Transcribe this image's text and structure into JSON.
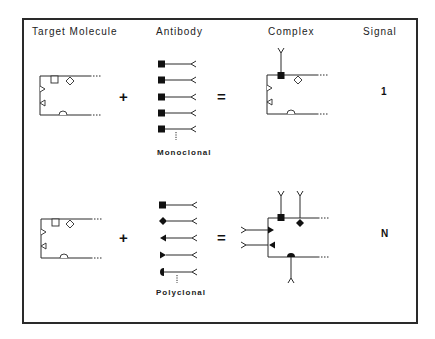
{
  "headers": {
    "target_molecule": "Target Molecule",
    "antibody": "Antibody",
    "complex": "Complex",
    "signal": "Signal"
  },
  "rows": [
    {
      "name": "monoclonal",
      "operator_plus": "+",
      "operator_equals": "=",
      "antibody_label": "Monoclonal",
      "antibody_heads": [
        "square",
        "square",
        "square",
        "square",
        "square"
      ],
      "complex_bound_sites": [
        "square"
      ],
      "signal": "1"
    },
    {
      "name": "polyclonal",
      "operator_plus": "+",
      "operator_equals": "=",
      "antibody_label": "Polyclonal",
      "antibody_heads": [
        "square",
        "diamond",
        "triangle-left",
        "triangle-right",
        "semicircle"
      ],
      "complex_bound_sites": [
        "square",
        "diamond",
        "triangle-right",
        "triangle-left",
        "semicircle"
      ],
      "signal": "N"
    }
  ],
  "target_molecule_epitopes": [
    "square",
    "diamond",
    "triangle-right",
    "triangle-left",
    "semicircle"
  ],
  "colors": {
    "line": "#2a2a2a",
    "fill": "#111111",
    "background": "#ffffff"
  }
}
